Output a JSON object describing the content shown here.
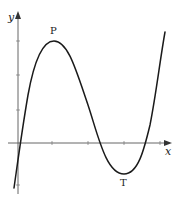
{
  "figure": {
    "type": "curve-sketch",
    "axes": {
      "x_label": "x",
      "y_label": "y",
      "origin_px": [
        18,
        143
      ],
      "x_ticks_px": [
        52,
        88,
        124,
        160
      ],
      "y_ticks_px": [
        41,
        75,
        110,
        185
      ]
    },
    "points": {
      "max": {
        "label": "P",
        "px": [
          54,
          41
        ]
      },
      "min": {
        "label": "T",
        "px": [
          124,
          174
        ]
      }
    },
    "colors": {
      "curve": "#1a1a1a",
      "axes": "#555555",
      "background": "#ffffff"
    }
  }
}
